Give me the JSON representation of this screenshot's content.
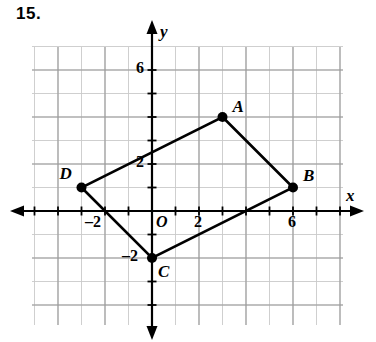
{
  "problem": {
    "number": "15."
  },
  "chart_data": {
    "type": "scatter",
    "title": "",
    "xlabel": "x",
    "ylabel": "y",
    "xlim": [
      -5,
      8
    ],
    "ylim": [
      -6,
      7
    ],
    "grid": true,
    "grid_step": 1,
    "legend": "none",
    "x_tick_labels": [
      {
        "value": -2,
        "text": "–2"
      },
      {
        "value": 2,
        "text": "2"
      },
      {
        "value": 6,
        "text": "6"
      }
    ],
    "y_tick_labels": [
      {
        "value": -2,
        "text": "–2"
      },
      {
        "value": 2,
        "text": "2"
      },
      {
        "value": 6,
        "text": "6"
      }
    ],
    "origin_label": "O",
    "points": [
      {
        "name": "A",
        "x": 3,
        "y": 4,
        "label_dx": 10,
        "label_dy": -20
      },
      {
        "name": "B",
        "x": 6,
        "y": 1,
        "label_dx": 10,
        "label_dy": -22
      },
      {
        "name": "C",
        "x": 0,
        "y": -2,
        "label_dx": 6,
        "label_dy": 4
      },
      {
        "name": "D",
        "x": -3,
        "y": 1,
        "label_dx": -22,
        "label_dy": -24
      }
    ],
    "polygon": [
      "A",
      "B",
      "C",
      "D"
    ],
    "annotations": [
      "Quadrilateral ABCD plotted on a coordinate plane",
      "Vertices joined in order A-B-C-D-A"
    ]
  },
  "colors": {
    "line": "#000000",
    "grid_major": "#9a9a9a",
    "grid_minor": "#c9c9c9",
    "axis": "#000000",
    "background": "#ffffff"
  }
}
